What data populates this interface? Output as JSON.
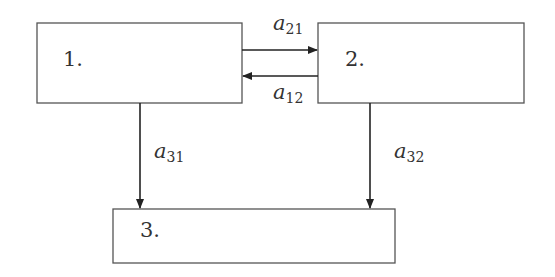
{
  "diagram": {
    "type": "compartment-flow",
    "nodes": [
      {
        "id": "1",
        "label": "1."
      },
      {
        "id": "2",
        "label": "2."
      },
      {
        "id": "3",
        "label": "3."
      }
    ],
    "edges": [
      {
        "from": "1",
        "to": "2",
        "label_base": "a",
        "label_sub": "21"
      },
      {
        "from": "2",
        "to": "1",
        "label_base": "a",
        "label_sub": "12"
      },
      {
        "from": "1",
        "to": "3",
        "label_base": "a",
        "label_sub": "31"
      },
      {
        "from": "2",
        "to": "3",
        "label_base": "a",
        "label_sub": "32"
      }
    ]
  }
}
